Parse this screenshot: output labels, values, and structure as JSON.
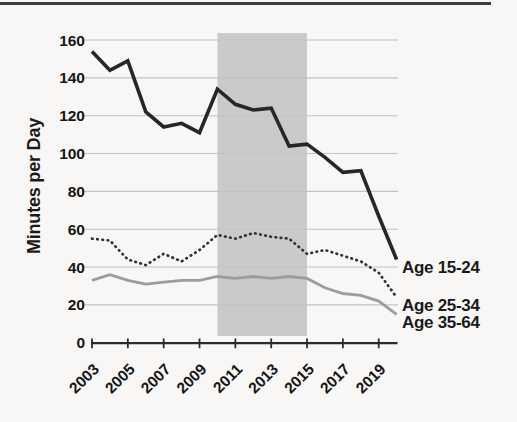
{
  "colors": {
    "background": "#f8f7f5",
    "top_rule": "#3d3d3d",
    "grid": "#c2c2c2",
    "axis": "#2b2b2b",
    "text": "#1a1a1a",
    "highlight_band": "#cacaca"
  },
  "chart_data": {
    "type": "line",
    "title": "",
    "xlabel": "",
    "ylabel": "Minutes per Day",
    "years": [
      2003,
      2004,
      2005,
      2006,
      2007,
      2008,
      2009,
      2010,
      2011,
      2012,
      2013,
      2014,
      2015,
      2016,
      2017,
      2018,
      2019,
      2020
    ],
    "x_tick_labels": [
      "2003",
      "2005",
      "2007",
      "2009",
      "2011",
      "2013",
      "2015",
      "2017",
      "2019"
    ],
    "x_tick_years": [
      2003,
      2005,
      2007,
      2009,
      2011,
      2013,
      2015,
      2017,
      2019
    ],
    "y_ticks": [
      0,
      20,
      40,
      60,
      80,
      100,
      120,
      140,
      160
    ],
    "ylim": [
      0,
      160
    ],
    "grid": true,
    "legend_position": "line-end-labels-right",
    "highlight_band": {
      "from_year": 2010,
      "to_year": 2015,
      "color": "#cacaca"
    },
    "series": [
      {
        "name": "Age 15-24",
        "style": "solid",
        "color": "#272727",
        "width": 3.6,
        "values": [
          154,
          144,
          149,
          122,
          114,
          116,
          111,
          134,
          126,
          123,
          124,
          104,
          105,
          98,
          90,
          91,
          67,
          44
        ]
      },
      {
        "name": "Age 25-34",
        "style": "dotted",
        "color": "#333333",
        "width": 2.7,
        "values": [
          55,
          54,
          44,
          41,
          47,
          43,
          49,
          57,
          55,
          58,
          56,
          55,
          47,
          49,
          46,
          43,
          37,
          24
        ]
      },
      {
        "name": "Age 35-64",
        "style": "solid",
        "color": "#9c9c9c",
        "width": 2.8,
        "values": [
          33,
          36,
          33,
          31,
          32,
          33,
          33,
          35,
          34,
          35,
          34,
          35,
          34,
          29,
          26,
          25,
          22,
          15
        ]
      }
    ]
  }
}
